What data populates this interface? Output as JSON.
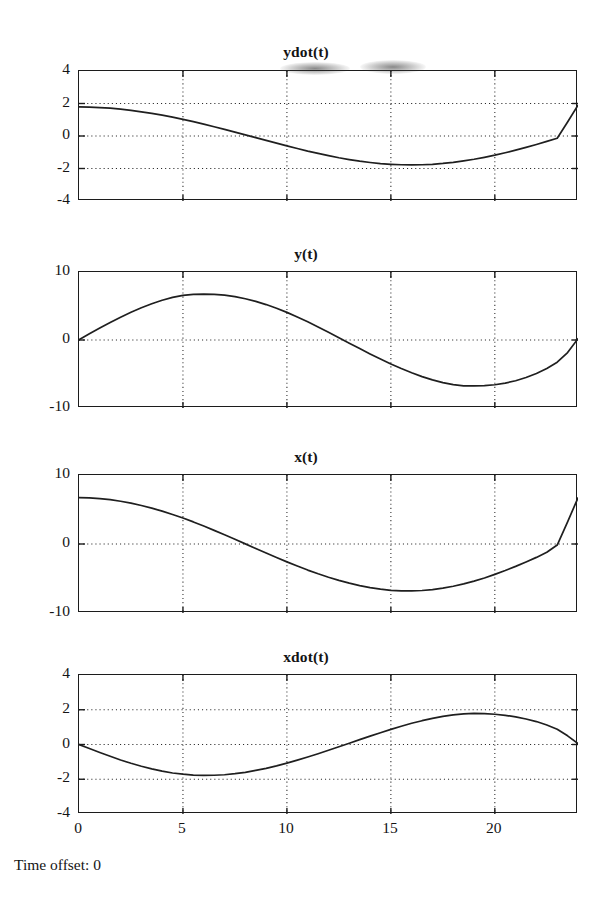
{
  "figure": {
    "footer_label": "Time offset: 0",
    "axis_color": "#1c1c1c",
    "curve_color": "#1f1f1f",
    "grid_color": "#2a2a2a",
    "background": "#ffffff"
  },
  "chart_data": [
    {
      "type": "line",
      "title": "ydot(t)",
      "xlabel": "",
      "ylabel": "",
      "xlim": [
        0,
        24
      ],
      "ylim": [
        -4,
        4
      ],
      "xticks": [
        0,
        5,
        10,
        15,
        20
      ],
      "yticks": [
        -4,
        -2,
        0,
        2,
        4
      ],
      "xtick_labels": [
        "",
        "",
        "",
        "",
        ""
      ],
      "ytick_labels": [
        "4",
        "2",
        "0",
        "-2",
        "-4"
      ],
      "grid": true,
      "grid_x": [
        5,
        10,
        15,
        20
      ],
      "grid_y": [
        -2,
        0,
        2
      ],
      "legend": null,
      "series": [
        {
          "name": "ydot(t)",
          "comment": "approx 1.85*cos(2*pi*t/24.3) sampled every 0.5",
          "x": [
            0,
            0.5,
            1,
            1.5,
            2,
            2.5,
            3,
            3.5,
            4,
            4.5,
            5,
            5.5,
            6,
            6.5,
            7,
            7.5,
            8,
            8.5,
            9,
            9.5,
            10,
            10.5,
            11,
            11.5,
            12,
            12.5,
            13,
            13.5,
            14,
            14.5,
            15,
            15.5,
            16,
            16.5,
            17,
            17.5,
            18,
            18.5,
            19,
            19.5,
            20,
            20.5,
            21,
            21.5,
            22,
            22.5,
            23,
            23.5,
            24
          ],
          "y": [
            1.79,
            1.78,
            1.75,
            1.71,
            1.65,
            1.58,
            1.49,
            1.39,
            1.28,
            1.16,
            1.02,
            0.88,
            0.73,
            0.57,
            0.41,
            0.24,
            0.07,
            -0.1,
            -0.27,
            -0.44,
            -0.61,
            -0.77,
            -0.93,
            -1.07,
            -1.21,
            -1.34,
            -1.45,
            -1.55,
            -1.63,
            -1.7,
            -1.74,
            -1.77,
            -1.78,
            -1.77,
            -1.74,
            -1.69,
            -1.62,
            -1.53,
            -1.43,
            -1.31,
            -1.18,
            -1.03,
            -0.87,
            -0.7,
            -0.52,
            -0.33,
            -0.14,
            0.86,
            1.9
          ]
        }
      ]
    },
    {
      "type": "line",
      "title": "y(t)",
      "xlabel": "",
      "ylabel": "",
      "xlim": [
        0,
        24
      ],
      "ylim": [
        -10,
        10
      ],
      "xticks": [
        0,
        5,
        10,
        15,
        20
      ],
      "yticks": [
        -10,
        0,
        10
      ],
      "xtick_labels": [
        "",
        "",
        "",
        "",
        ""
      ],
      "ytick_labels": [
        "10",
        "0",
        "-10"
      ],
      "grid": true,
      "grid_x": [
        5,
        10,
        15,
        20
      ],
      "grid_y": [
        0
      ],
      "legend": null,
      "series": [
        {
          "name": "y(t)",
          "comment": "approx 6.75*sin(2*pi*t/24.2) sampled every 0.5",
          "x": [
            0,
            0.5,
            1,
            1.5,
            2,
            2.5,
            3,
            3.5,
            4,
            4.5,
            5,
            5.5,
            6,
            6.5,
            7,
            7.5,
            8,
            8.5,
            9,
            9.5,
            10,
            10.5,
            11,
            11.5,
            12,
            12.5,
            13,
            13.5,
            14,
            14.5,
            15,
            15.5,
            16,
            16.5,
            17,
            17.5,
            18,
            18.5,
            19,
            19.5,
            20,
            20.5,
            21,
            21.5,
            22,
            22.5,
            23,
            23.5,
            24
          ],
          "y": [
            0.05,
            0.92,
            1.77,
            2.58,
            3.36,
            4.08,
            4.74,
            5.33,
            5.84,
            6.26,
            6.57,
            6.72,
            6.75,
            6.72,
            6.6,
            6.38,
            6.07,
            5.68,
            5.21,
            4.67,
            4.06,
            3.39,
            2.67,
            1.92,
            1.14,
            0.34,
            -0.46,
            -1.26,
            -2.05,
            -2.8,
            -3.52,
            -4.2,
            -4.82,
            -5.38,
            -5.86,
            -6.26,
            -6.56,
            -6.74,
            -6.76,
            -6.72,
            -6.58,
            -6.34,
            -5.99,
            -5.52,
            -4.92,
            -4.18,
            -3.26,
            -1.85,
            0.2
          ]
        }
      ]
    },
    {
      "type": "line",
      "title": "x(t)",
      "xlabel": "",
      "ylabel": "",
      "xlim": [
        0,
        24
      ],
      "ylim": [
        -10,
        10
      ],
      "xticks": [
        0,
        5,
        10,
        15,
        20
      ],
      "yticks": [
        -10,
        0,
        10
      ],
      "xtick_labels": [
        "",
        "",
        "",
        "",
        ""
      ],
      "ytick_labels": [
        "10",
        "0",
        "-10"
      ],
      "grid": true,
      "grid_x": [
        5,
        10,
        15,
        20
      ],
      "grid_y": [
        0
      ],
      "legend": null,
      "series": [
        {
          "name": "x(t)",
          "comment": "approx 6.8*cos(2*pi*t/24.2) sampled every 0.5",
          "x": [
            0,
            0.5,
            1,
            1.5,
            2,
            2.5,
            3,
            3.5,
            4,
            4.5,
            5,
            5.5,
            6,
            6.5,
            7,
            7.5,
            8,
            8.5,
            9,
            9.5,
            10,
            10.5,
            11,
            11.5,
            12,
            12.5,
            13,
            13.5,
            14,
            14.5,
            15,
            15.5,
            16,
            16.5,
            17,
            17.5,
            18,
            18.5,
            19,
            19.5,
            20,
            20.5,
            21,
            21.5,
            22,
            22.5,
            23,
            23.5,
            24
          ],
          "y": [
            6.72,
            6.68,
            6.58,
            6.42,
            6.2,
            5.92,
            5.58,
            5.2,
            4.76,
            4.28,
            3.76,
            3.2,
            2.6,
            1.98,
            1.34,
            0.68,
            0.02,
            -0.65,
            -1.31,
            -1.96,
            -2.59,
            -3.2,
            -3.78,
            -4.32,
            -4.82,
            -5.28,
            -5.68,
            -6.03,
            -6.32,
            -6.55,
            -6.71,
            -6.79,
            -6.8,
            -6.74,
            -6.6,
            -6.4,
            -6.12,
            -5.78,
            -5.38,
            -4.92,
            -4.4,
            -3.84,
            -3.24,
            -2.6,
            -1.94,
            -1.2,
            -0.15,
            3.2,
            6.7
          ]
        }
      ]
    },
    {
      "type": "line",
      "title": "xdot(t)",
      "xlabel": "",
      "ylabel": "",
      "xlim": [
        0,
        24
      ],
      "ylim": [
        -4,
        4
      ],
      "xticks": [
        0,
        5,
        10,
        15,
        20
      ],
      "yticks": [
        -4,
        -2,
        0,
        2,
        4
      ],
      "xtick_labels": [
        "0",
        "5",
        "10",
        "15",
        "20"
      ],
      "ytick_labels": [
        "4",
        "2",
        "0",
        "-2",
        "-4"
      ],
      "grid": true,
      "grid_x": [
        5,
        10,
        15,
        20
      ],
      "grid_y": [
        -2,
        0,
        2
      ],
      "legend": null,
      "series": [
        {
          "name": "xdot(t)",
          "comment": "approx -1.78*sin(2*pi*t/24.2) sampled every 0.5",
          "x": [
            0,
            0.5,
            1,
            1.5,
            2,
            2.5,
            3,
            3.5,
            4,
            4.5,
            5,
            5.5,
            6,
            6.5,
            7,
            7.5,
            8,
            8.5,
            9,
            9.5,
            10,
            10.5,
            11,
            11.5,
            12,
            12.5,
            13,
            13.5,
            14,
            14.5,
            15,
            15.5,
            16,
            16.5,
            17,
            17.5,
            18,
            18.5,
            19,
            19.5,
            20,
            20.5,
            21,
            21.5,
            22,
            22.5,
            23,
            23.5,
            24
          ],
          "y": [
            0.0,
            -0.23,
            -0.46,
            -0.68,
            -0.89,
            -1.08,
            -1.25,
            -1.4,
            -1.53,
            -1.64,
            -1.71,
            -1.76,
            -1.78,
            -1.77,
            -1.74,
            -1.68,
            -1.6,
            -1.49,
            -1.37,
            -1.23,
            -1.07,
            -0.9,
            -0.72,
            -0.53,
            -0.33,
            -0.13,
            0.07,
            0.28,
            0.48,
            0.68,
            0.87,
            1.05,
            1.22,
            1.37,
            1.5,
            1.62,
            1.71,
            1.76,
            1.79,
            1.78,
            1.74,
            1.68,
            1.59,
            1.47,
            1.32,
            1.12,
            0.88,
            0.5,
            0.05
          ]
        }
      ]
    }
  ]
}
